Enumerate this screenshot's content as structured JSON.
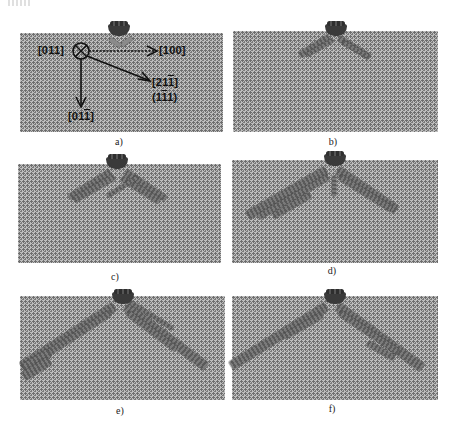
{
  "figure": {
    "panels": [
      {
        "id": "a",
        "caption": "a)",
        "orientation_labels": {
          "out_of_plane": {
            "prefix": "[01",
            "overlined": "",
            "rest": "1]",
            "text": "[011]"
          },
          "x_axis": {
            "text": "[100]"
          },
          "diagonal_direction": {
            "prefix": "[21",
            "overlined": "1",
            "suffix": "]",
            "text": "[21̅1]"
          },
          "diagonal_plane": {
            "prefix": "(1",
            "overlined": "1",
            "suffix": "1)",
            "text": "(1̅1 1)"
          },
          "y_axis": {
            "prefix": "[01",
            "overlined": "1",
            "suffix": "]",
            "text": "[01̅1]"
          }
        }
      },
      {
        "id": "b",
        "caption": "b)"
      },
      {
        "id": "c",
        "caption": "c)"
      },
      {
        "id": "d",
        "caption": "d)"
      },
      {
        "id": "e",
        "caption": "e)"
      },
      {
        "id": "f",
        "caption": "f)"
      }
    ]
  },
  "colors": {
    "lattice_background": "#bdbdbd",
    "lattice_atoms": "#6e6e6e",
    "indenter": "#3a3a3a",
    "slip_band": "#6b6b6b",
    "text": "#111111"
  }
}
